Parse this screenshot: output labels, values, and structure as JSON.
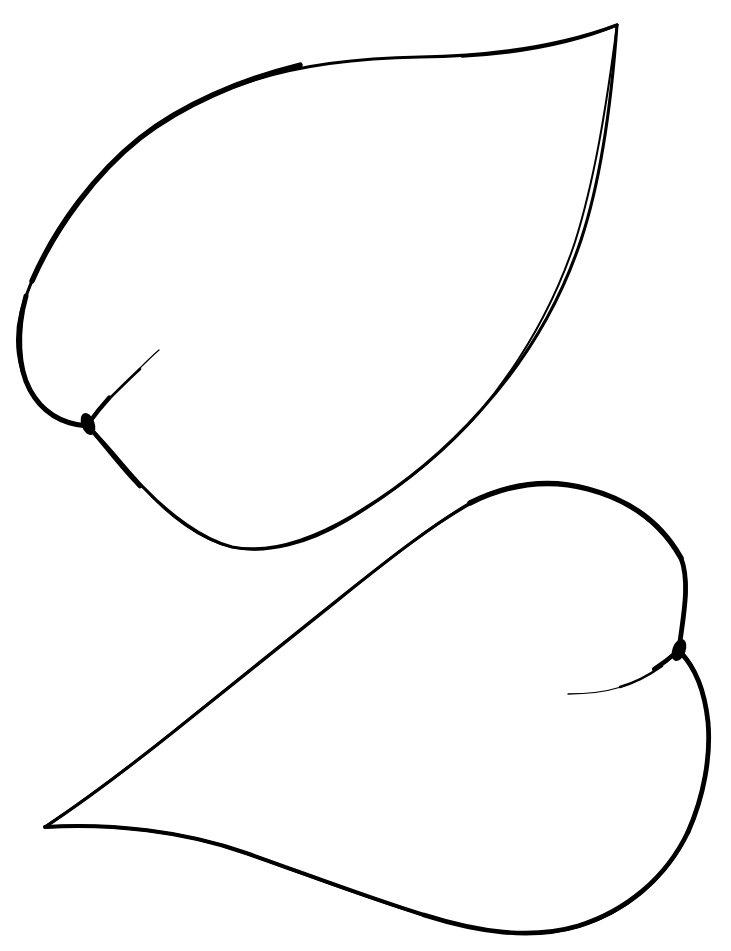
{
  "document": {
    "title": "Leaf Outline Drawing",
    "type": "line-art-illustration",
    "subject": "two simple ovate leaf blade outlines",
    "caption": "",
    "background_color": "#ffffff",
    "ink_color": "#000000",
    "canvas": {
      "width": 731,
      "height": 951
    }
  },
  "figure": {
    "name": "two-leaf-outline",
    "style": "black ink contour line drawing, no shading, no fill",
    "objects_count": 2
  },
  "objects": [
    {
      "id": "upper-leaf",
      "label": "Upper leaf",
      "orientation": "apex points to upper right",
      "apex_point": "617,25",
      "base_point": "87,425",
      "leftmost_point": "18,295",
      "lowest_point": "225,547",
      "outline_path": "M 617 25 C 560 46 492 56 420 57 C 352 58 290 66 236 86 C 176 108 127 141 93 184 C 56 230 30 277 21 312 C 14 340 18 368 30 390 C 44 415 64 425 87 426 C 104 440 122 465 143 487 C 170 515 203 540 232 547 C 268 554 311 540 352 516 C 398 489 444 452 482 409 C 526 360 560 303 581 240 C 601 180 611 108 617 25 Z",
      "vein_path": "M 88 424 C 101 406 118 387 134 373 C 144 364 152 356 158 350",
      "stroke_width_min": 1.6,
      "stroke_width_max": 5.5,
      "sinus_node": {
        "cx": 88,
        "cy": 424,
        "rx": 6.5,
        "ry": 11,
        "rotate": -18
      }
    },
    {
      "id": "lower-leaf",
      "label": "Lower leaf",
      "orientation": "apex points to lower left",
      "apex_point": "45,827",
      "base_point": "679,650",
      "rightmost_point": "708,724",
      "lowest_point": "480,930",
      "outline_path": "M 45 827 C 86 800 128 768 172 733 C 226 690 284 643 338 600 C 390 558 437 521 477 500 C 514 481 551 479 588 489 C 628 500 661 523 680 557 C 693 582 681 623 679 650 C 695 665 705 692 708 722 C 711 760 703 802 684 840 C 662 882 625 912 580 926 C 534 940 482 933 427 916 C 368 898 307 875 246 853 C 183 831 111 823 45 827 Z",
      "vein_path": "M 678 651 C 661 666 641 679 620 686 C 602 692 583 694 568 694",
      "stroke_width_min": 1.6,
      "stroke_width_max": 5.5,
      "sinus_node": {
        "cx": 679,
        "cy": 650,
        "rx": 6.5,
        "ry": 11,
        "rotate": 18
      }
    }
  ],
  "colors": {
    "ink": "#000000",
    "paper": "#ffffff"
  }
}
